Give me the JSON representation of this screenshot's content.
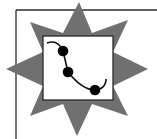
{
  "icon": {
    "name": "chart-badge-icon",
    "description": "Gray eight-pointed star behind a white framed square containing a curved line with three black data points",
    "colors": {
      "background": "#ffffff",
      "star": "#707070",
      "frame_line": "#2a2a2a",
      "square_fill": "#ffffff",
      "square_border": "#2a2a2a",
      "curve": "#111111",
      "points": "#000000"
    },
    "points": [
      {
        "x": 63,
        "y": 51
      },
      {
        "x": 68,
        "y": 72
      },
      {
        "x": 95,
        "y": 90
      }
    ]
  }
}
